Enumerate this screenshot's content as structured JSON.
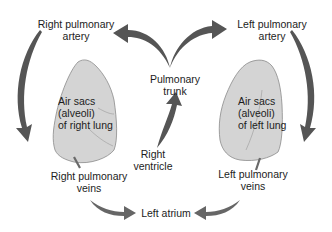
{
  "diagram": {
    "labels": {
      "right_pulmonary_artery": [
        "Right pulmonary",
        "artery"
      ],
      "left_pulmonary_artery": [
        "Left pulmonary",
        "artery"
      ],
      "pulmonary_trunk": [
        "Pulmonary",
        "trunk"
      ],
      "right_ventricle": [
        "Right",
        "ventricle"
      ],
      "right_lung": [
        "Air sacs",
        "(alveoli)",
        "of right lung"
      ],
      "left_lung": [
        "Air sacs",
        "(alveoli)",
        "of left lung"
      ],
      "right_pulmonary_veins": [
        "Right pulmonary",
        "veins"
      ],
      "left_pulmonary_veins": [
        "Left pulmonary",
        "veins"
      ],
      "left_atrium": "Left atrium"
    },
    "flow": [
      {
        "from": "Right ventricle",
        "to": "Pulmonary trunk"
      },
      {
        "from": "Pulmonary trunk",
        "to": "Right pulmonary artery"
      },
      {
        "from": "Pulmonary trunk",
        "to": "Left pulmonary artery"
      },
      {
        "from": "Right pulmonary artery",
        "to": "Air sacs (alveoli) of right lung"
      },
      {
        "from": "Left pulmonary artery",
        "to": "Air sacs (alveoli) of left lung"
      },
      {
        "from": "Right pulmonary veins",
        "to": "Left atrium"
      },
      {
        "from": "Left pulmonary veins",
        "to": "Left atrium"
      }
    ],
    "colors": {
      "arrow": "#555555",
      "lung_fill": "#d4d4d4",
      "lung_stroke": "#8a8a8a",
      "text": "#1c1c1c",
      "background": "#ffffff"
    }
  }
}
